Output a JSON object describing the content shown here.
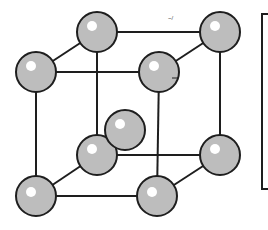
{
  "diagram": {
    "colors": {
      "atom_fill": "#bdbdbd",
      "atom_stroke": "#1e1e1e",
      "edge": "#1e1e1e",
      "highlight": "#ffffff",
      "background": "#ffffff"
    },
    "atom_radius": 20,
    "atoms": [
      {
        "id": "back-top-left",
        "x": 97,
        "y": 32
      },
      {
        "id": "back-top-right",
        "x": 220,
        "y": 32
      },
      {
        "id": "back-bottom-left",
        "x": 97,
        "y": 155
      },
      {
        "id": "back-bottom-right",
        "x": 220,
        "y": 155
      },
      {
        "id": "body-center",
        "x": 125,
        "y": 130
      },
      {
        "id": "front-top-left",
        "x": 36,
        "y": 72
      },
      {
        "id": "front-top-right",
        "x": 159,
        "y": 72
      },
      {
        "id": "front-bottom-left",
        "x": 36,
        "y": 196
      },
      {
        "id": "front-bottom-right",
        "x": 157,
        "y": 196
      }
    ],
    "stray_mark": "~/"
  }
}
